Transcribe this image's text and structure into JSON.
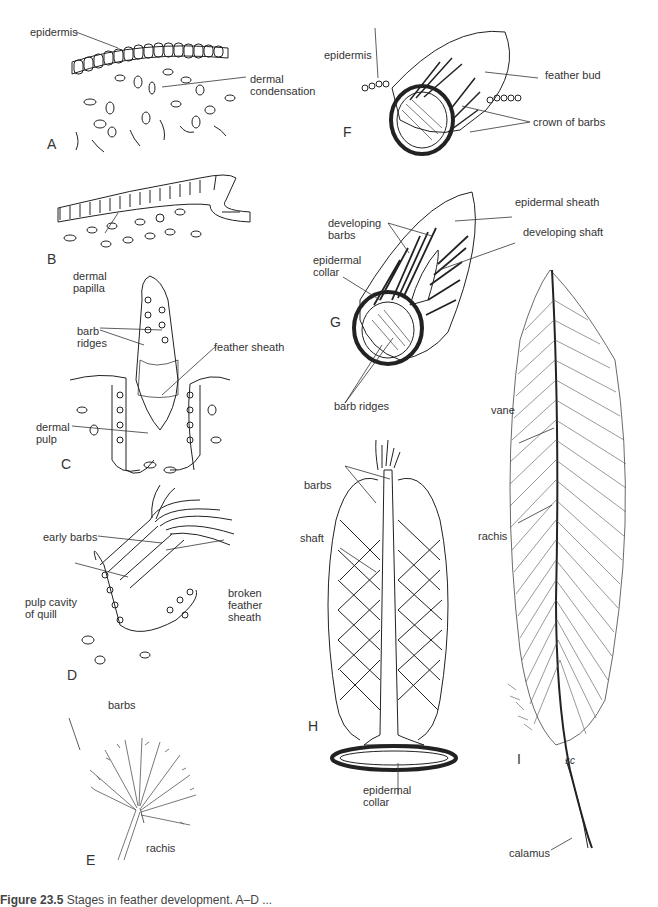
{
  "figure": {
    "caption_number": "Figure 23.5",
    "caption_text": "Stages in feather development. A–D ...",
    "colors": {
      "ink": "#222222",
      "label": "#333333",
      "background": "#ffffff"
    }
  },
  "panels": [
    {
      "id": "A",
      "labels": [
        "epidermis",
        "dermal\ncondensation"
      ]
    },
    {
      "id": "B",
      "labels": [
        "dermal\npapilla"
      ]
    },
    {
      "id": "C",
      "labels": [
        "barb\nridges",
        "feather sheath",
        "dermal\npulp"
      ]
    },
    {
      "id": "D",
      "labels": [
        "early barbs",
        "pulp cavity\nof quill",
        "broken\nfeather\nsheath"
      ]
    },
    {
      "id": "E",
      "labels": [
        "barbs",
        "rachis"
      ]
    },
    {
      "id": "F",
      "labels": [
        "epidermis",
        "feather bud",
        "crown of barbs"
      ]
    },
    {
      "id": "G",
      "labels": [
        "epidermal sheath",
        "developing\nbarbs",
        "developing shaft",
        "epidermal\ncollar",
        "barb ridges"
      ]
    },
    {
      "id": "H",
      "labels": [
        "barbs",
        "shaft",
        "epidermal\ncollar"
      ]
    },
    {
      "id": "I",
      "labels": [
        "vane",
        "rachis",
        "calamus"
      ],
      "signature": "sc"
    }
  ]
}
